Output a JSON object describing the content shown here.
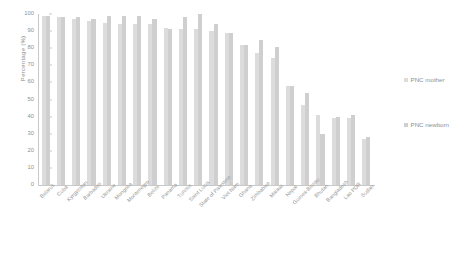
{
  "chart_data": {
    "type": "bar",
    "title": "",
    "xlabel": "",
    "ylabel": "Percentage (%)",
    "ylim": [
      0,
      100
    ],
    "yticks": [
      0,
      10,
      20,
      30,
      40,
      50,
      60,
      70,
      80,
      90,
      100
    ],
    "grid": false,
    "legend_position": "right",
    "categories": [
      "Belarus",
      "Cuba",
      "Kyrgyzstan",
      "Barbados",
      "Ukraine",
      "Mongolia",
      "Montenegro",
      "Belize",
      "Panama",
      "Tunisia",
      "Saint Lucia",
      "State of Palestine",
      "Viet Nam",
      "Ghana",
      "Zimbabwe",
      "Malawi",
      "Nepal",
      "Guinea-Bissau",
      "Bhutan",
      "Bangladesh",
      "Lao PDR",
      "Sudan"
    ],
    "series": [
      {
        "name": "PNC mother",
        "color": "#dcdcdc",
        "values": [
          99,
          98,
          97,
          96,
          95,
          94,
          94,
          94,
          92,
          91,
          91,
          90,
          89,
          82,
          77,
          74,
          58,
          47,
          41,
          39,
          39,
          27
        ]
      },
      {
        "name": "PNC newborn",
        "color": "#cfcfcf",
        "values": [
          99,
          98,
          98,
          97,
          99,
          99,
          99,
          97,
          91,
          98,
          100,
          94,
          89,
          82,
          85,
          81,
          58,
          54,
          30,
          40,
          41,
          28
        ]
      }
    ]
  },
  "legend": {
    "entries": [
      {
        "label": "PNC mother"
      },
      {
        "label": "PNC newborn"
      }
    ]
  },
  "axes": {
    "y_title": "Percentage (%)"
  }
}
